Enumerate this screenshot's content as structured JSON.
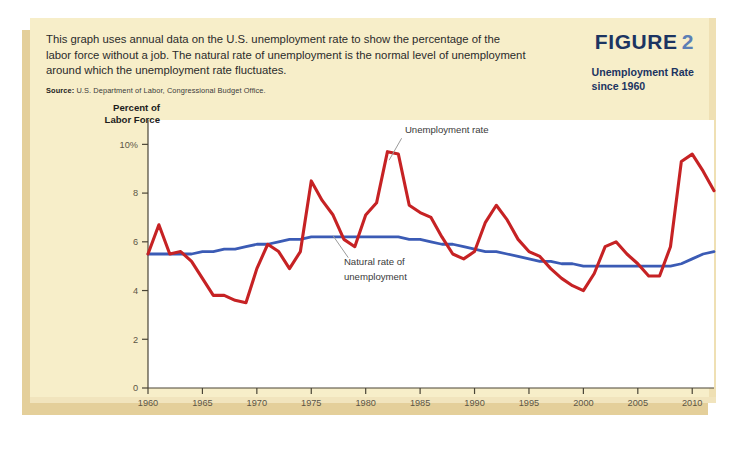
{
  "figure": {
    "label": "FIGURE",
    "number": "2",
    "subtitle_line1": "Unemployment Rate",
    "subtitle_line2": "since 1960",
    "label_color": "#1c3461",
    "number_color": "#5c7fb5"
  },
  "blurb": "This graph uses annual data on the U.S. unemployment rate to show the percentage of the labor force without a job. The natural rate of unemployment is the normal level of unemployment around which the unemployment rate fluctuates.",
  "source_label": "Source:",
  "source_text": "U.S. Department of Labor, Congressional Budget Office.",
  "chart_data": {
    "type": "line",
    "title": "Unemployment Rate since 1960",
    "xlabel": "",
    "ylabel": "Percent of Labor Force",
    "ylabel_line1": "Percent of",
    "ylabel_line2": "Labor Force",
    "xlim": [
      1960,
      2012
    ],
    "ylim": [
      0,
      11
    ],
    "yticks": [
      0,
      2,
      4,
      6,
      8,
      10
    ],
    "ytick_labels": [
      "0",
      "2",
      "4",
      "6",
      "8",
      "10%"
    ],
    "xticks": [
      1960,
      1965,
      1970,
      1975,
      1980,
      1985,
      1990,
      1995,
      2000,
      2005,
      2010
    ],
    "xtick_labels": [
      "1960",
      "1965",
      "1970",
      "1975",
      "1980",
      "1985",
      "1990",
      "1995",
      "2000",
      "2005",
      "2010"
    ],
    "grid": false,
    "legend_position": "inline-annotations",
    "annotations": [
      {
        "name": "unemployment-rate-label",
        "text": "Unemployment rate",
        "x": 1983.6,
        "y": 10.45
      },
      {
        "name": "natural-rate-label",
        "text": "Natural rate of",
        "x": 1978.0,
        "y": 5.05
      },
      {
        "name": "natural-rate-label2",
        "text": "unemployment",
        "x": 1978.0,
        "y": 4.45
      }
    ],
    "x": [
      1960,
      1961,
      1962,
      1963,
      1964,
      1965,
      1966,
      1967,
      1968,
      1969,
      1970,
      1971,
      1972,
      1973,
      1974,
      1975,
      1976,
      1977,
      1978,
      1979,
      1980,
      1981,
      1982,
      1983,
      1984,
      1985,
      1986,
      1987,
      1988,
      1989,
      1990,
      1991,
      1992,
      1993,
      1994,
      1995,
      1996,
      1997,
      1998,
      1999,
      2000,
      2001,
      2002,
      2003,
      2004,
      2005,
      2006,
      2007,
      2008,
      2009,
      2010,
      2011,
      2012
    ],
    "series": [
      {
        "name": "Unemployment rate",
        "color": "#c62224",
        "width": 3.1,
        "values": [
          5.5,
          6.7,
          5.5,
          5.6,
          5.2,
          4.5,
          3.8,
          3.8,
          3.6,
          3.5,
          4.9,
          5.9,
          5.6,
          4.9,
          5.6,
          8.5,
          7.7,
          7.1,
          6.1,
          5.8,
          7.1,
          7.6,
          9.7,
          9.6,
          7.5,
          7.2,
          7.0,
          6.2,
          5.5,
          5.3,
          5.6,
          6.8,
          7.5,
          6.9,
          6.1,
          5.6,
          5.4,
          4.9,
          4.5,
          4.2,
          4.0,
          4.7,
          5.8,
          6.0,
          5.5,
          5.1,
          4.6,
          4.6,
          5.8,
          9.3,
          9.6,
          8.9,
          8.1
        ]
      },
      {
        "name": "Natural rate of unemployment",
        "color": "#3b5bb5",
        "width": 2.8,
        "values": [
          5.5,
          5.5,
          5.5,
          5.5,
          5.5,
          5.6,
          5.6,
          5.7,
          5.7,
          5.8,
          5.9,
          5.9,
          6.0,
          6.1,
          6.1,
          6.2,
          6.2,
          6.2,
          6.2,
          6.2,
          6.2,
          6.2,
          6.2,
          6.2,
          6.1,
          6.1,
          6.0,
          5.9,
          5.9,
          5.8,
          5.7,
          5.6,
          5.6,
          5.5,
          5.4,
          5.3,
          5.2,
          5.2,
          5.1,
          5.1,
          5.0,
          5.0,
          5.0,
          5.0,
          5.0,
          5.0,
          5.0,
          5.0,
          5.0,
          5.1,
          5.3,
          5.5,
          5.6
        ]
      }
    ]
  }
}
